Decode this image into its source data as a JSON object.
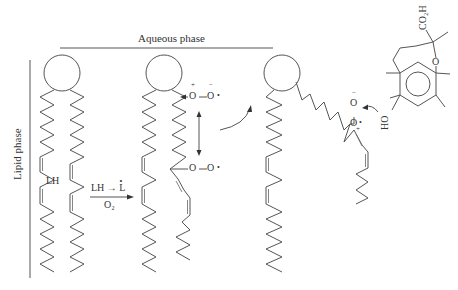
{
  "labels": {
    "aqueous_phase": "Aqueous phase",
    "lipid_phase": "Lipid phase",
    "lipid_LH": "LH",
    "reaction_top": "LH → L",
    "reaction_dot": "•",
    "reaction_bottom": "O₂",
    "peroxyl_O1": "O",
    "peroxyl_O2": "O",
    "peroxyl_charge_plus": "+",
    "peroxyl_charge_minus": "−",
    "peroxyl_radical_dot": "•",
    "antioxidant_carboxyl": "CO₂H",
    "antioxidant_ring_O": "O",
    "antioxidant_hydroxyl": "HO"
  },
  "molecules": [
    {
      "name": "phospholipid-1",
      "state": "intact",
      "tail_label": "LH"
    },
    {
      "name": "phospholipid-2",
      "state": "peroxyl radical formed"
    },
    {
      "name": "phospholipid-3",
      "state": "peroxyl radical migrates to interface"
    },
    {
      "name": "trolox-antioxidant",
      "groups": [
        "CO2H",
        "O",
        "HO"
      ]
    }
  ],
  "colors": {
    "line": "#555555",
    "text": "#333333",
    "background": "#ffffff"
  }
}
